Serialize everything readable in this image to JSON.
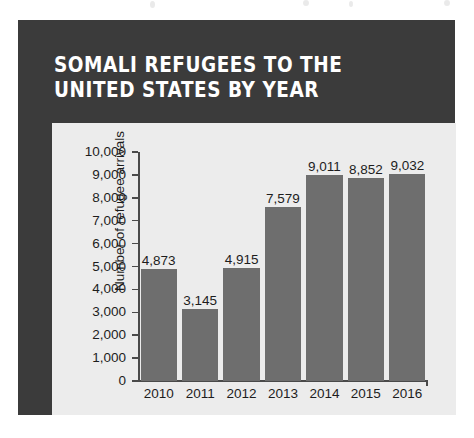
{
  "headline": "SOMALI REFUGEES TO THE UNITED STATES BY YEAR",
  "colors": {
    "frame": "#3b3b3b",
    "panel": "#ececec",
    "bar": "#6e6e6e",
    "axis": "#4a4a4a",
    "headline_text": "#ffffff",
    "body_text": "#1d1d1d",
    "page_background": "#ffffff"
  },
  "chart_data": {
    "type": "bar",
    "title": "SOMALI REFUGEES TO THE UNITED STATES BY YEAR",
    "xlabel": "",
    "ylabel": "Number of refugee arrivals",
    "categories": [
      "2010",
      "2011",
      "2012",
      "2013",
      "2014",
      "2015",
      "2016"
    ],
    "values": [
      4873,
      3145,
      4915,
      7579,
      9011,
      8852,
      9032
    ],
    "value_labels": [
      "4,873",
      "3,145",
      "4,915",
      "7,579",
      "9,011",
      "8,852",
      "9,032"
    ],
    "ylim": [
      0,
      10000
    ],
    "ytick_values": [
      0,
      1000,
      2000,
      3000,
      4000,
      5000,
      6000,
      7000,
      8000,
      9000,
      10000
    ],
    "ytick_labels": [
      "0",
      "1,000",
      "2,000",
      "3,000",
      "4,000",
      "5,000",
      "6,000",
      "7,000",
      "8,000",
      "9,000",
      "10,000"
    ],
    "grid": false,
    "legend": false,
    "series": [
      {
        "name": "Refugee arrivals",
        "values": [
          4873,
          3145,
          4915,
          7579,
          9011,
          8852,
          9032
        ]
      }
    ]
  }
}
